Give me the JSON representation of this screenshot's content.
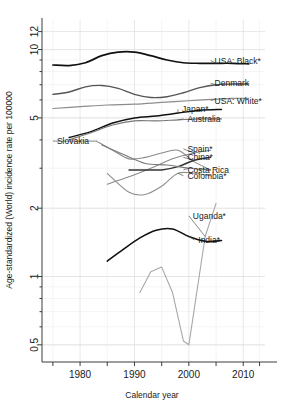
{
  "chart_data": {
    "type": "line",
    "title": "",
    "xlabel": "Calendar year",
    "ylabel": "Age-standardized (World) incidence rate per 100000",
    "yscale": "log",
    "xlim": [
      1973,
      2014
    ],
    "ylim": [
      0.42,
      13.5
    ],
    "grid": true,
    "legend_position": "right-inline-labels",
    "xticks": [
      1980,
      1990,
      2000,
      2010
    ],
    "xticklabels": [
      "1980",
      "1990",
      "2000",
      "2010"
    ],
    "xticks_minor": [
      1975,
      1985,
      1995,
      2005,
      2013
    ],
    "yticks": [
      0.5,
      1,
      2,
      5,
      10,
      12
    ],
    "yticklabels": [
      "0.5",
      "1",
      "2",
      "5",
      "10",
      "12"
    ],
    "series": [
      {
        "name": "USA: Black*",
        "label": "USA: Black*",
        "color": "#111111",
        "width": 1.7,
        "label_x": 2004,
        "label_y": 8.95,
        "x": [
          1975,
          1978,
          1981,
          1984,
          1987,
          1990,
          1993,
          1996,
          1999,
          2002,
          2005,
          2008,
          2011
        ],
        "y": [
          8.55,
          8.5,
          8.75,
          9.4,
          9.75,
          9.75,
          9.4,
          9.0,
          8.75,
          8.7,
          8.7,
          8.7,
          8.65
        ]
      },
      {
        "name": "Denmark",
        "label": "Denmark",
        "color": "#555555",
        "width": 1.4,
        "label_x": 2004,
        "label_y": 7.1,
        "x": [
          1975,
          1978,
          1981,
          1984,
          1987,
          1990,
          1993,
          1996,
          1999,
          2002,
          2005,
          2008,
          2011
        ],
        "y": [
          6.35,
          6.5,
          6.85,
          6.95,
          6.75,
          6.35,
          6.15,
          6.2,
          6.45,
          6.8,
          7.0,
          7.05,
          7.05
        ]
      },
      {
        "name": "USA: White*",
        "label": "USA: White*",
        "color": "#8c8c8c",
        "width": 1.2,
        "label_x": 2004,
        "label_y": 5.95,
        "x": [
          1975,
          1980,
          1985,
          1990,
          1995,
          2000,
          2005,
          2008,
          2011
        ],
        "y": [
          5.5,
          5.6,
          5.7,
          5.75,
          5.85,
          5.95,
          6.05,
          6.1,
          6.1
        ]
      },
      {
        "name": "Japan*",
        "label": "Japan*",
        "color": "#111111",
        "width": 1.5,
        "label_x": 1998,
        "label_y": 5.45,
        "x": [
          1978,
          1982,
          1986,
          1990,
          1994,
          1998,
          2002,
          2006
        ],
        "y": [
          4.1,
          4.35,
          4.75,
          5.0,
          5.1,
          5.25,
          5.4,
          5.45
        ]
      },
      {
        "name": "Australia",
        "label": "Australia",
        "color": "#777777",
        "width": 1.2,
        "label_x": 1999,
        "label_y": 4.95,
        "x": [
          1978,
          1982,
          1986,
          1990,
          1994,
          1998,
          2002,
          2006
        ],
        "y": [
          4.0,
          4.3,
          4.65,
          4.85,
          4.85,
          4.9,
          4.95,
          4.95
        ]
      },
      {
        "name": "Slovakia",
        "label": "Slovakia",
        "color": "#8a8a8a",
        "width": 1.1,
        "label_x": 1975,
        "label_y": 3.95,
        "x": [
          1983,
          1986,
          1989,
          1992,
          1995,
          1998,
          2001,
          2004
        ],
        "y": [
          3.95,
          3.6,
          3.3,
          3.35,
          3.5,
          3.6,
          3.2,
          2.95
        ]
      },
      {
        "name": "Spain*",
        "label": "Spain*",
        "color": "#8a8a8a",
        "width": 1.1,
        "label_x": 1999,
        "label_y": 3.65,
        "x": [
          1985,
          1989,
          1993,
          1997,
          2001,
          2004
        ],
        "y": [
          2.55,
          2.75,
          3.0,
          3.3,
          3.5,
          3.6
        ]
      },
      {
        "name": "China*",
        "label": "China*",
        "color": "#333333",
        "width": 1.5,
        "label_x": 1999,
        "label_y": 3.35,
        "x": [
          1989,
          1992,
          1995,
          1998,
          2001,
          2004
        ],
        "y": [
          2.95,
          2.95,
          2.95,
          3.05,
          3.25,
          3.35
        ]
      },
      {
        "name": "Costa Rica",
        "label": "Costa Rica",
        "color": "#7a7a7a",
        "width": 1.1,
        "label_x": 1999,
        "label_y": 2.95,
        "x": [
          1984,
          1988,
          1992,
          1996,
          2000,
          2004
        ],
        "y": [
          3.8,
          3.45,
          3.15,
          3.1,
          3.0,
          2.95
        ]
      },
      {
        "name": "Colombia*",
        "label": "Colombia*",
        "color": "#8f8f8f",
        "width": 1.1,
        "label_x": 1999,
        "label_y": 2.78,
        "x": [
          1985,
          1989,
          1992,
          1995,
          1998,
          2001,
          2004
        ],
        "y": [
          2.85,
          2.35,
          2.3,
          2.5,
          2.85,
          2.85,
          2.78
        ]
      },
      {
        "name": "Uganda*",
        "label": "Uganda*",
        "color": "#a8a8a8",
        "width": 1.1,
        "label_x": 2000,
        "label_y": 1.85,
        "x": [
          1991,
          1993,
          1995,
          1997,
          1999,
          2000,
          2001,
          2003,
          2005
        ],
        "y": [
          0.85,
          1.05,
          1.1,
          0.85,
          0.52,
          0.5,
          0.72,
          1.5,
          2.1
        ]
      },
      {
        "name": "India*",
        "label": "India*",
        "color": "#111111",
        "width": 1.6,
        "label_x": 2001,
        "label_y": 1.45,
        "x": [
          1985,
          1988,
          1991,
          1994,
          1997,
          2000,
          2003,
          2006
        ],
        "y": [
          1.17,
          1.32,
          1.48,
          1.6,
          1.62,
          1.5,
          1.43,
          1.44
        ]
      }
    ]
  },
  "axes": {
    "x_title": "Calendar year",
    "y_title": "Age-standardized (World) incidence rate per 100000"
  }
}
